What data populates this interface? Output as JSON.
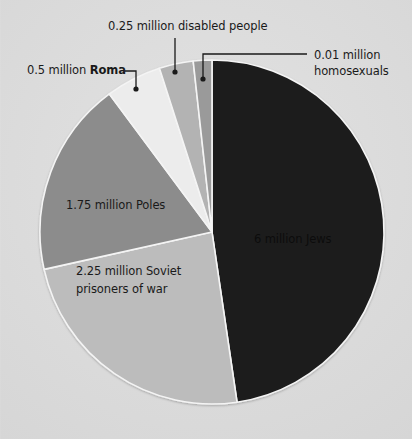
{
  "chart_data": {
    "type": "pie",
    "title": "",
    "unit": "million",
    "start_angle_deg": 0,
    "direction": "clockwise",
    "slices": [
      {
        "label": "6 million Jews",
        "value": 6,
        "color": "#1e1e1e"
      },
      {
        "label": "2.25 million Soviet prisoners of war",
        "value": 2.25,
        "color": "#bcbcbc"
      },
      {
        "label": "1.75 million Poles",
        "value": 1.75,
        "color": "#8c8c8c"
      },
      {
        "label": "0.5 million Roma",
        "value": 0.5,
        "color": "#ececec"
      },
      {
        "label": "0.25 million disabled people",
        "value": 0.25,
        "color": "#b3b3b3"
      },
      {
        "label": "0.01 million homosexuals",
        "value": 0.01,
        "color": "#9a9a9a"
      }
    ],
    "categories": [
      "Jews",
      "Soviet prisoners of war",
      "Poles",
      "Roma",
      "disabled people",
      "homosexuals"
    ],
    "values": [
      6,
      2.25,
      1.75,
      0.5,
      0.25,
      0.01
    ],
    "legend": "none (callout labels)"
  },
  "labels": {
    "jews": "6 million Jews",
    "soviet_line1": "2.25 million Soviet",
    "soviet_line2": "prisoners of war",
    "poles": "1.75 million Poles",
    "roma_prefix": "0.5 million ",
    "roma_bold": "Roma",
    "disabled": "0.25 million disabled people",
    "homosexuals_line1": "0.01 million",
    "homosexuals_line2": "homosexuals"
  }
}
